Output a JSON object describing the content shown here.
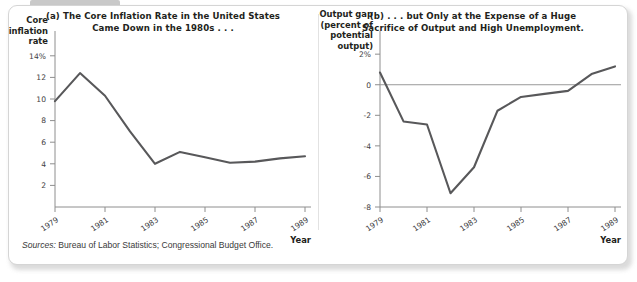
{
  "figure": {
    "sources_label": "Sources:",
    "sources_text": "Bureau of Labor Statistics; Congressional Budget Office."
  },
  "chart_data": [
    {
      "type": "line",
      "panel": "a",
      "title": "(a) The Core Inflation Rate in the United States Came Down in the 1980s . . .",
      "title_line1": "(a) The Core Inflation Rate in the United States",
      "title_line2": "Came Down in the 1980s . . .",
      "ylabel": "Core inflation rate",
      "ylabel_lines": [
        "Core",
        "inflation",
        "rate"
      ],
      "xlabel": "Year",
      "x": [
        1979,
        1980,
        1981,
        1982,
        1983,
        1984,
        1985,
        1986,
        1987,
        1988,
        1989
      ],
      "values": [
        9.8,
        12.4,
        10.3,
        7.0,
        4.0,
        5.1,
        4.6,
        4.1,
        4.2,
        4.5,
        4.7
      ],
      "xticks": [
        1979,
        1981,
        1983,
        1985,
        1987,
        1989
      ],
      "xtick_labels": [
        "1979",
        "1981",
        "1983",
        "1985",
        "1987",
        "1989"
      ],
      "yticks": [
        2,
        4,
        6,
        8,
        10,
        12,
        14
      ],
      "ytick_labels": [
        "2",
        "4",
        "6",
        "8",
        "10",
        "12",
        "14%"
      ],
      "ylim": [
        0,
        15
      ],
      "xlim": [
        1979,
        1989
      ],
      "grid": false,
      "legend": "none",
      "line_color": "#58585a"
    },
    {
      "type": "line",
      "panel": "b",
      "title": "(b) . . . but Only at the Expense of a Huge Sacrifice of Output and High Unemployment.",
      "title_line1": "(b) . . . but Only at the Expense of a Huge",
      "title_line2": "Sacrifice of Output and High Unemployment.",
      "ylabel": "Output gap (percent of potential output)",
      "ylabel_lines": [
        "Output gap",
        "(percent of",
        "potential",
        "output)"
      ],
      "xlabel": "Year",
      "x": [
        1979,
        1980,
        1981,
        1982,
        1983,
        1984,
        1985,
        1986,
        1987,
        1988,
        1989
      ],
      "values": [
        0.8,
        -2.4,
        -2.6,
        -7.1,
        -5.4,
        -1.7,
        -0.8,
        -0.6,
        -0.4,
        0.7,
        1.2
      ],
      "xticks": [
        1979,
        1981,
        1983,
        1985,
        1987,
        1989
      ],
      "xtick_labels": [
        "1979",
        "1981",
        "1983",
        "1985",
        "1987",
        "1989"
      ],
      "yticks": [
        -8,
        -6,
        -4,
        -2,
        0,
        2
      ],
      "ytick_labels": [
        "-8",
        "-6",
        "-4",
        "-2",
        "0",
        "2%"
      ],
      "ylim": [
        -8,
        2.6
      ],
      "xlim": [
        1979,
        1989
      ],
      "zero_line": 0,
      "grid": false,
      "legend": "none",
      "line_color": "#58585a"
    }
  ]
}
